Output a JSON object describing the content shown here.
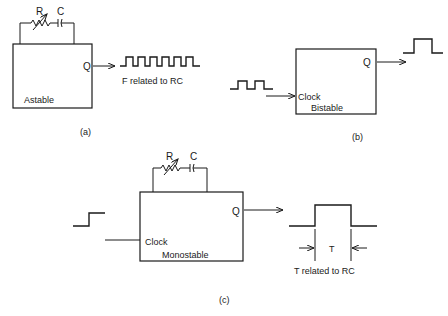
{
  "diagram": {
    "panel_a": {
      "caption": "(a)",
      "block_label": "Astable",
      "output_label": "Q",
      "resistor_label": "R",
      "capacitor_label": "C",
      "waveform_caption": "F related to RC"
    },
    "panel_b": {
      "caption": "(b)",
      "block_label": "Bistable",
      "input_label": "Clock",
      "output_label": "Q"
    },
    "panel_c": {
      "caption": "(c)",
      "block_label": "Monostable",
      "input_label": "Clock",
      "output_label": "Q",
      "resistor_label": "R",
      "capacitor_label": "C",
      "pulse_width_label": "T",
      "waveform_caption": "T related to RC"
    }
  }
}
